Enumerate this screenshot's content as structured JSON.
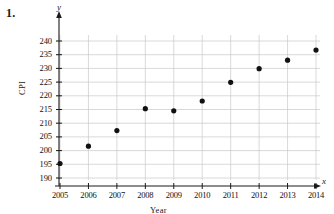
{
  "problem": {
    "number": "1."
  },
  "axis_letters": {
    "y": "y",
    "x": "x"
  },
  "chart_data": {
    "type": "scatter",
    "title": "",
    "xlabel": "Year",
    "ylabel": "CPI",
    "x": [
      2005,
      2006,
      2007,
      2008,
      2009,
      2010,
      2011,
      2012,
      2013,
      2014
    ],
    "values": [
      195.3,
      201.6,
      207.3,
      215.3,
      214.5,
      218.1,
      224.9,
      229.9,
      233.0,
      236.7
    ],
    "categories": [
      "2005",
      "2006",
      "2007",
      "2008",
      "2009",
      "2010",
      "2011",
      "2012",
      "2013",
      "2014"
    ],
    "xticks": [
      "2005",
      "2006",
      "2007",
      "2008",
      "2009",
      "2010",
      "2011",
      "2012",
      "2013",
      "2014"
    ],
    "yticks": [
      "190",
      "195",
      "200",
      "205",
      "210",
      "215",
      "220",
      "225",
      "230",
      "235",
      "240"
    ],
    "xlim": [
      2005,
      2014
    ],
    "ylim": [
      190,
      240
    ],
    "grid": true,
    "legend": false,
    "marker": "filled-circle",
    "marker_color": "#111111",
    "grid_color": "#c8c8c8",
    "axis_color": "#1a1a1a"
  }
}
